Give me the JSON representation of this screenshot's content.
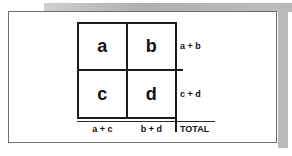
{
  "diagram": {
    "type": "2x2-contingency-table",
    "cells": [
      {
        "id": "a",
        "label": "a",
        "position": "top-left"
      },
      {
        "id": "b",
        "label": "b",
        "position": "top-right"
      },
      {
        "id": "c",
        "label": "c",
        "position": "bottom-left"
      },
      {
        "id": "d",
        "label": "d",
        "position": "bottom-right"
      }
    ],
    "row_totals": [
      {
        "id": "row1",
        "label": "a + b"
      },
      {
        "id": "row2",
        "label": "c + d"
      }
    ],
    "column_totals": [
      {
        "id": "col1",
        "label": "a + c"
      },
      {
        "id": "col2",
        "label": "b + d"
      }
    ],
    "grand_total": {
      "id": "total",
      "label": "TOTAL"
    }
  },
  "colors": {
    "ink": "#1b1b1b",
    "frame": "#6e6e6e",
    "paper": "#ffffff",
    "shadow": "#b9b9b9"
  }
}
